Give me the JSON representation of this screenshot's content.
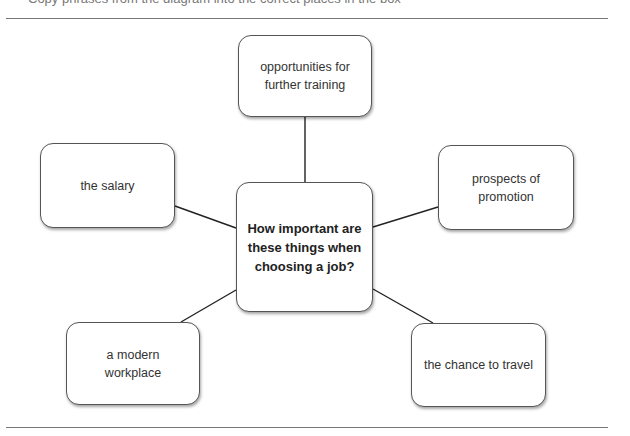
{
  "header": {
    "cut_off_text": "Copy phrases from the diagram into the correct places in the box"
  },
  "diagram": {
    "center": {
      "label": "How important are these things when choosing a job?"
    },
    "nodes": [
      {
        "id": "top",
        "label": "opportunities for further training"
      },
      {
        "id": "left",
        "label": "the salary"
      },
      {
        "id": "right",
        "label": "prospects of promotion"
      },
      {
        "id": "bottom-left",
        "label": "a modern workplace"
      },
      {
        "id": "bottom-right",
        "label": "the chance to travel"
      }
    ]
  }
}
